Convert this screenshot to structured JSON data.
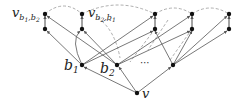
{
  "diagram": {
    "labels": {
      "v_b1_b2": {
        "main": "v",
        "sub": "b",
        "sub1": "1",
        "comma": ",",
        "sub2": "b",
        "sub2n": "2"
      },
      "v_b2_b1": {
        "main": "v",
        "sub": "b",
        "sub1": "2",
        "comma": ",",
        "sub2": "b",
        "sub2n": "1"
      },
      "b1": {
        "main": "b",
        "sub": "1"
      },
      "b2": {
        "main": "b",
        "sub": "2"
      },
      "v": "v",
      "dots_middle": "⋯",
      "dots_top": "⋯"
    },
    "colors": {
      "node": "#111111",
      "edge": "#555555",
      "dashed": "#888888"
    }
  }
}
